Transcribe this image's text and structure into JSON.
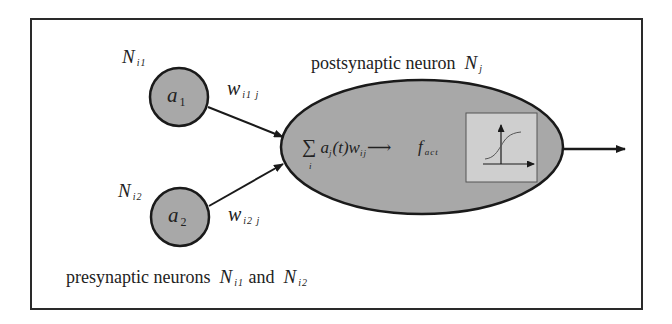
{
  "diagram": {
    "colors": {
      "frame": "#2a2a2a",
      "node_fill": "#a8a8a8",
      "node_stroke": "#1a1a1a",
      "activation_box_fill": "#cfcfcf",
      "text": "#222222"
    },
    "presynaptic": [
      {
        "id": "Ni1",
        "label_main": "N",
        "label_sub": "i1",
        "activation_main": "a",
        "activation_sub": "1",
        "weight_main": "w",
        "weight_sub": "i1 j"
      },
      {
        "id": "Ni2",
        "label_main": "N",
        "label_sub": "i2",
        "activation_main": "a",
        "activation_sub": "2",
        "weight_main": "w",
        "weight_sub": "i2 j"
      }
    ],
    "postsynaptic": {
      "title_text": "postsynaptic neuron",
      "label_main": "N",
      "label_sub": "j",
      "sum_symbol": "∑",
      "sum_index": "i",
      "formula_a": "a",
      "formula_a_sub": "j",
      "formula_t": "(t)",
      "formula_w": "w",
      "formula_w_sub": "ij",
      "arrow_glyph": "⟶",
      "activation_main": "f",
      "activation_sub": "act"
    },
    "caption": {
      "text_prefix": "presynaptic neurons",
      "n1_main": "N",
      "n1_sub": "i1",
      "conjunction": "and",
      "n2_main": "N",
      "n2_sub": "i2"
    }
  }
}
